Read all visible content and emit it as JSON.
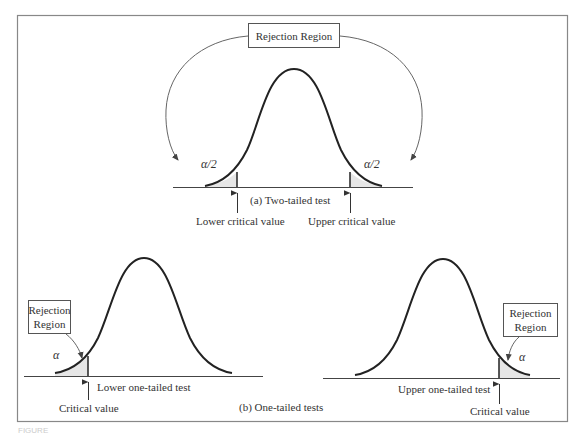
{
  "figure": {
    "panel_a": {
      "caption": "(a)   Two-tailed test",
      "rejection_label": "Rejection Region",
      "left_tail": "α/2",
      "right_tail": "α/2",
      "lower_critical": "Lower critical value",
      "upper_critical": "Upper critical value"
    },
    "panel_b": {
      "caption": "(b)   One-tailed tests",
      "left": {
        "rejection_label_line1": "Rejection",
        "rejection_label_line2": "Region",
        "tail": "α",
        "test_label": "Lower one-tailed test",
        "critical": "Critical value"
      },
      "right": {
        "rejection_label_line1": "Rejection",
        "rejection_label_line2": "Region",
        "tail": "α",
        "test_label": "Upper one-tailed test",
        "critical": "Critical value"
      }
    },
    "caption_faded": "FIGURE"
  }
}
